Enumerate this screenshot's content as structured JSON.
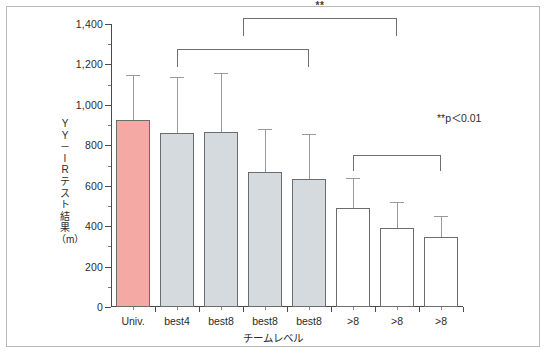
{
  "chart_data": {
    "type": "bar",
    "title": "",
    "xlabel": "チームレベル",
    "ylabel": "YY–IRテスト結果（m）",
    "ylim": [
      0,
      1400
    ],
    "ytick_step": 200,
    "grid": false,
    "legend_position": "upper-right",
    "categories": [
      "Univ.",
      "best4",
      "best8",
      "best8",
      "best8",
      ">8",
      ">8",
      ">8"
    ],
    "values": [
      925,
      862,
      868,
      670,
      635,
      488,
      393,
      345
    ],
    "error_upper": [
      1150,
      1140,
      1158,
      880,
      855,
      640,
      520,
      450
    ],
    "bar_colors": [
      "#f4a9a4",
      "#d4dadd",
      "#d4dadd",
      "#d4dadd",
      "#d4dadd",
      "#ffffff",
      "#ffffff",
      "#ffffff"
    ],
    "annotations": [
      {
        "label": "**",
        "from": "best4",
        "to": "best8",
        "note": "bracket over bars 2–5"
      },
      {
        "label": "**",
        "from": "best8",
        "to": ">8",
        "note": "bracket over bars 6–8"
      },
      {
        "label": "**",
        "note": "top bracket linking the two groups"
      }
    ],
    "significance_note": "**p＜0.01"
  },
  "axis": {
    "y_ticks": [
      "1,400",
      "1,200",
      "1,000",
      "800",
      "600",
      "400",
      "200",
      "0"
    ],
    "y_title_chars": [
      "Y",
      "Y",
      "－",
      "I",
      "R",
      "テ",
      "ス",
      "ト",
      "結",
      "果"
    ],
    "y_title_unit": "（m）",
    "x_title": "チームレベル"
  },
  "sig": {
    "star": "**",
    "legend": "**p＜0.01"
  },
  "colors": {
    "pink_bar": "#f4a9a4",
    "gray_bar": "#d4dadd",
    "white_bar": "#ffffff",
    "bar_outline": "#6c6c6c",
    "axis": "#4a4a4a",
    "error_bar": "#9a9a9a",
    "frame": "#b9b9b9"
  }
}
